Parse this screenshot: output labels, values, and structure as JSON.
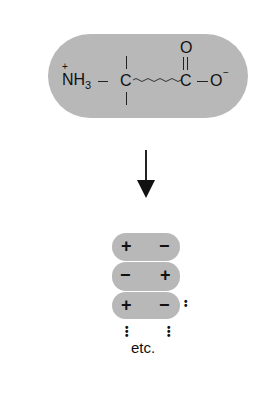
{
  "molecule": {
    "charge_plus": "+",
    "amine": "NH",
    "amine_sub": "3",
    "alpha_carbon": "C",
    "carbonyl_carbon": "C",
    "carbonyl_oxygen": "O",
    "carboxylate_oxygen": "O",
    "charge_minus": "−",
    "backbone_wave": "~~~~~~~~",
    "fill_color": "#b8b8b8"
  },
  "arrow": {
    "direction": "down"
  },
  "stack": {
    "rows": [
      {
        "left": "+",
        "right": "−"
      },
      {
        "left": "−",
        "right": "+"
      },
      {
        "left": "+",
        "right": "−"
      }
    ],
    "label": "etc.",
    "continuation": ":"
  }
}
